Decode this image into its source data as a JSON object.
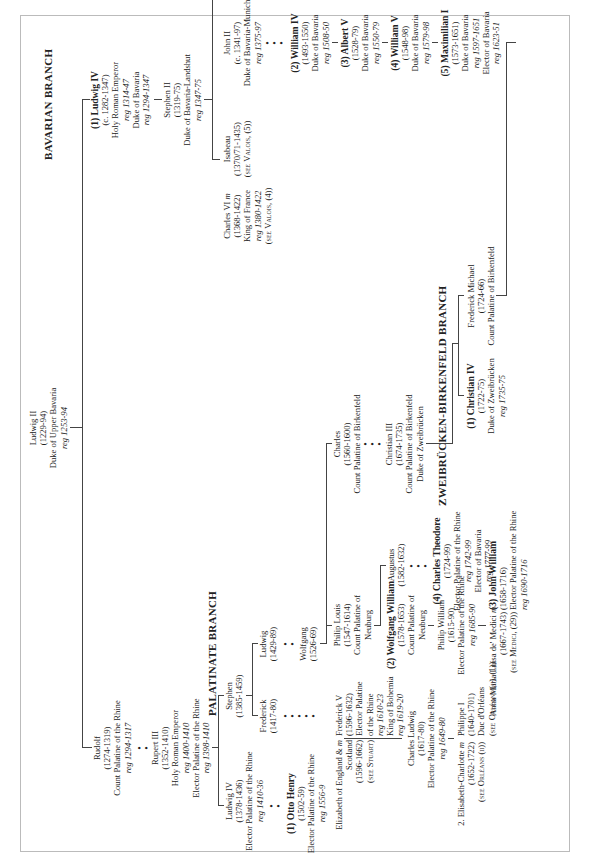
{
  "root": {
    "name": "Ludwig II",
    "dates": "(1229-94)",
    "title": "Duke of Upper Bavaria",
    "reign": "reg 1253-94"
  },
  "branches": {
    "bavarian": "BAVARIAN BRANCH",
    "palatinate": "PALATINATE BRANCH",
    "zweibrucken": "ZWEIBRÜCKEN-BIRKENFELD BRANCH"
  },
  "bavarian": {
    "ludwig_iv": {
      "name": "(1) Ludwig IV",
      "dates": "(c. 1282-1347)",
      "l1": "Holy Roman Emperor",
      "l2": "reg 1314-47",
      "l3": "Duke of Bavaria",
      "l4": "reg 1294-1347"
    },
    "stephen_ii": {
      "name": "Stephen II",
      "dates": "(1319-75)",
      "l1": "Duke of Bavaria-Landshut",
      "l2": "reg 1347-75"
    },
    "charles_vi": {
      "name": "Charles VI",
      "m": "m",
      "dates": "(1368-1422)",
      "l1": "King of France",
      "l2": "reg 1380-1422",
      "l3": "(see Valois, (4))"
    },
    "isabeau": {
      "name": "Isabeau",
      "dates": "(1370/71-1435)",
      "l1": "(see Valois, (5))"
    },
    "john_ii": {
      "name": "John II",
      "dates": "(c. 1341-97)",
      "l1": "Duke of Bavaria-Munich",
      "l2": "reg 1375-97"
    },
    "william_iv": {
      "name": "(2) William IV",
      "dates": "(1493-1550)",
      "l1": "Duke of Bavaria",
      "l2": "reg 1508-50"
    },
    "albert_v": {
      "name": "(3) Albert V",
      "dates": "(1528-79)",
      "l1": "Duke of Bavaria",
      "l2": "reg 1550-79"
    },
    "william_v": {
      "name": "(4) William V",
      "dates": "(1548-98)",
      "l1": "Duke of Bavaria",
      "l2": "reg 1579-98"
    },
    "maximilian_i": {
      "name": "(5) Maximilian I",
      "dates": "(1573-1651)",
      "l1": "Duke of Bavaria",
      "l2": "reg 1597-1651",
      "l3": "Elector of Bavaria",
      "l4": "reg 1623-51"
    }
  },
  "palatinate": {
    "rudolf": {
      "name": "Rudolf",
      "dates": "(1274-1319)",
      "l1": "Count Palatine of the Rhine",
      "l2": "reg 1294-1317"
    },
    "rupert_iii": {
      "name": "Rupert III",
      "dates": "(1352-1410)",
      "l1": "Holy Roman Emperor",
      "l2": "reg 1400-1410",
      "l3": "Elector Palatine of the Rhine",
      "l4": "reg 1398-1410"
    },
    "ludwig_iv_p": {
      "name": "Ludwig IV",
      "dates": "(1378-1436)",
      "l1": "Elector Palatine of the Rhine",
      "l2": "reg 1410-36"
    },
    "stephen": {
      "name": "Stephen",
      "dates": "(1385-1459)"
    },
    "frederick": {
      "name": "Frederick",
      "dates": "(1417-80)"
    },
    "ludwig": {
      "name": "Ludwig",
      "dates": "(1429-89)"
    },
    "wolfgang": {
      "name": "Wolfgang",
      "dates": "(1526-69)"
    },
    "otto_henry": {
      "name": "(1) Otto Henry",
      "dates": "(1502-59)",
      "l1": "Elector Palatine of the Rhine",
      "l2": "reg 1556-9"
    },
    "elizabeth": {
      "name": "Elizabeth of England &",
      "m": "m",
      "l1": "Scotland",
      "dates": "(1596-1662)",
      "l2": "(see Stuart)"
    },
    "frederick_v": {
      "name": "Frederick V",
      "dates": "(1596-1632)",
      "l1": "Elector Palatine",
      "l2": "of the Rhine",
      "l3": "reg 1610-23",
      "l4": "King of Bohemia",
      "l5": "reg 1619-20"
    },
    "charles_ludwig": {
      "name": "Charles Ludwig",
      "dates": "(1617-80)",
      "l1": "Elector Palatine of the Rhine",
      "l2": "reg 1649-80"
    },
    "elisabeth_charlotte": {
      "name": "2. Elisabeth-Charlotte",
      "m": "m",
      "dates": "(1652-1722)",
      "l1": "(see Orléans (ii))"
    },
    "philippe_i": {
      "name": "Philippe I",
      "dates": "(1640-1701)",
      "l1": "Duc d'Orléans",
      "l2": "(see Orléans (ii), (1))"
    },
    "philip_louis": {
      "name": "Philip Louis",
      "dates": "(1547-1614)",
      "l1": "Count Palatine of",
      "l2": "Neuburg"
    },
    "charles": {
      "name": "Charles",
      "dates": "(1560-1600)",
      "l1": "Count Palatine of Birkenfeld"
    },
    "wolfgang_william": {
      "name": "(2) Wolfgang William",
      "dates": "(1578-1653)",
      "l1": "Count Palatine of",
      "l2": "Neuburg"
    },
    "augustus": {
      "name": "Augustus",
      "dates": "(1582-1632)"
    },
    "philip_william": {
      "name": "Philip William",
      "dates": "(1615-90)",
      "l1": "Elector Palatine of the Rhine",
      "l2": "reg 1685-90"
    },
    "anna_maria": {
      "name": "Anna Maria Luisa de' Medici",
      "m": "m",
      "dates": "(1667-1743)",
      "l1": "(see Medici, (29))"
    },
    "john_william": {
      "name": "(3) John William",
      "dates": "(1658-1716)",
      "l1": "Elector Palatine of the Rhine",
      "l2": "reg 1690-1716"
    },
    "charles_theodore": {
      "name": "(4) Charles Theodore",
      "dates": "(1724-99)",
      "l1": "Elector Palatine of the Rhine",
      "l2": "reg 1742-99",
      "l3": "Elector of Bavaria",
      "l4": "reg 1777-99"
    },
    "christian_iii": {
      "name": "Christian III",
      "dates": "(1674-1735)",
      "l1": "Count Palatine of Birkenfeld",
      "l2": "Duke of Zweibrücken"
    }
  },
  "zweibrucken": {
    "christian_iv": {
      "name": "(1) Christian IV",
      "dates": "(1722-75)",
      "l1": "Duke of Zweibrücken",
      "l2": "reg 1735-75"
    },
    "frederick_michael": {
      "name": "Frederick Michael",
      "dates": "(1724-66)",
      "l1": "Count Palatine of Birkenfeld"
    }
  }
}
